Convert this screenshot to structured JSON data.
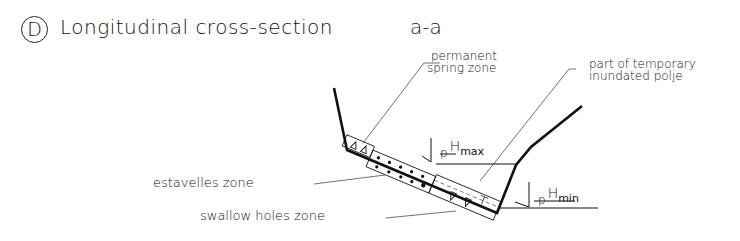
{
  "figure": {
    "panel_letter": "D",
    "title": "Longitudinal cross-section",
    "section_label": "a-a"
  },
  "labels": {
    "permanent_spring_zone": [
      "permanent",
      "spring zone"
    ],
    "temporary_polje": [
      "part of temporary",
      "inundated polje"
    ],
    "estavelles_zone": "estavelles zone",
    "swallow_holes_zone": "swallow holes zone"
  },
  "water_levels": {
    "max": {
      "prefix": "p",
      "symbol": "H",
      "subscript": "max"
    },
    "min": {
      "prefix": "p",
      "symbol": "H",
      "subscript": "min"
    }
  },
  "colors": {
    "line": "#111111",
    "background": "#ffffff"
  }
}
